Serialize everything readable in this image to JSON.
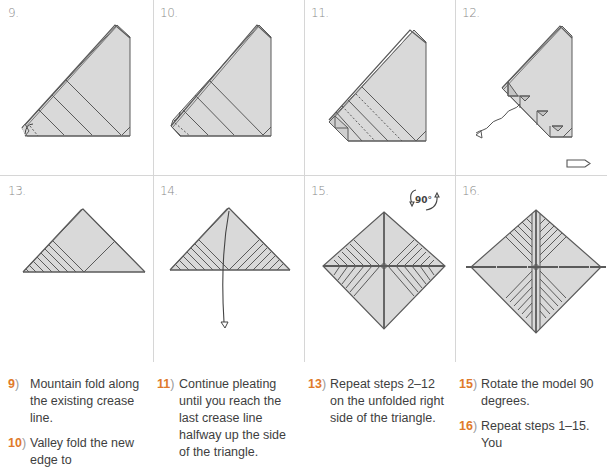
{
  "panels": [
    {
      "id": "9",
      "label": "9."
    },
    {
      "id": "10",
      "label": "10."
    },
    {
      "id": "11",
      "label": "11."
    },
    {
      "id": "12",
      "label": "12."
    },
    {
      "id": "13",
      "label": "13."
    },
    {
      "id": "14",
      "label": "14."
    },
    {
      "id": "15",
      "label": "15.",
      "rotate_label": "90°"
    },
    {
      "id": "16",
      "label": "16."
    }
  ],
  "colors": {
    "paper_fill": "#d9d9d9",
    "line": "#5a5a5a",
    "divider": "#d6d6d6",
    "step_number": "#e07a2a",
    "text": "#3e3e3e"
  },
  "instructions": [
    {
      "num": "9",
      "text": "Mountain fold along the existing crease line."
    },
    {
      "num": "10",
      "text": "Valley fold the new edge to the next crease line."
    },
    {
      "num": "11",
      "text": "Continue pleating until you reach the last crease line halfway up the side of the triangle."
    },
    {
      "num": "12",
      "text": "Unfold the triangle."
    },
    {
      "num": "13",
      "text": "Repeat steps 2–12 on the unfolded right side of the triangle."
    },
    {
      "num": "14",
      "text": "The square should now..."
    },
    {
      "num": "15",
      "text": "Rotate the model 90 degrees."
    },
    {
      "num": "16",
      "text": "Repeat steps 1–15. You will end..."
    }
  ],
  "visible_instructions": {
    "col1": [
      {
        "num": "9",
        "paren": ")",
        "text": "Mountain fold along the existing crease line."
      },
      {
        "num": "10",
        "paren": ")",
        "text": "Valley fold the new edge to"
      }
    ],
    "col2": [
      {
        "num": "11",
        "paren": ")",
        "text": "Continue pleating until you reach the last crease line halfway up the side of the triangle."
      }
    ],
    "col3": [
      {
        "num": "13",
        "paren": ")",
        "text": "Repeat steps 2–12 on the unfolded right side of the triangle."
      },
      {
        "num": "",
        "paren": ")",
        "text": ""
      }
    ],
    "col4": [
      {
        "num": "15",
        "paren": ")",
        "text": "Rotate the model 90 degrees."
      },
      {
        "num": "16",
        "paren": ")",
        "text": "Repeat steps 1–15. You"
      }
    ]
  }
}
